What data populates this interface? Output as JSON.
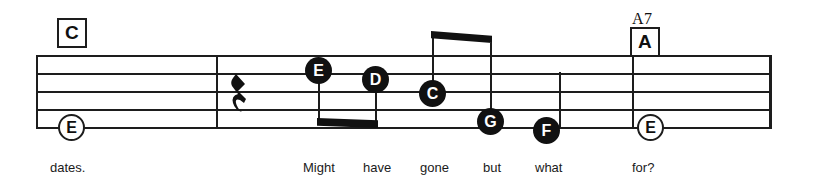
{
  "score": {
    "staff": {
      "line_count": 5,
      "top_y": 55,
      "line_spacing": 18,
      "left_x": 36,
      "right_x": 771
    },
    "barlines": [
      216,
      632
    ],
    "chords": [
      {
        "name": "chord-c",
        "label": "C",
        "superscript": "",
        "x": 57,
        "y": 18
      },
      {
        "name": "chord-a7",
        "label": "A",
        "superscript": "A7",
        "x": 630,
        "y": 24
      }
    ],
    "rest": {
      "label": "quarter-rest",
      "glyph": "➉",
      "x": 230,
      "y": 74
    },
    "notes": [
      {
        "pitch": "E",
        "head": "open",
        "x": 58,
        "y": 114,
        "stem": "none"
      },
      {
        "pitch": "E",
        "head": "filled",
        "x": 305,
        "y": 57,
        "stem": "down"
      },
      {
        "pitch": "D",
        "head": "filled",
        "x": 362,
        "y": 66,
        "stem": "down"
      },
      {
        "pitch": "C",
        "head": "filled",
        "x": 419,
        "y": 80,
        "stem": "up"
      },
      {
        "pitch": "G",
        "head": "filled",
        "x": 477,
        "y": 108,
        "stem": "up"
      },
      {
        "pitch": "F",
        "head": "filled",
        "x": 533,
        "y": 117,
        "stem": "up"
      },
      {
        "pitch": "E",
        "head": "open",
        "x": 637,
        "y": 114,
        "stem": "none"
      }
    ],
    "beams": [
      {
        "name": "beam-lower-ed",
        "x": 318,
        "y": 118,
        "width": 60,
        "height": 9,
        "slant": "down"
      },
      {
        "name": "beam-upper-cg",
        "x": 432,
        "y": 31,
        "width": 60,
        "height": 10,
        "slant": "down"
      }
    ],
    "lyrics": [
      {
        "text": "dates.",
        "x": 50
      },
      {
        "text": "Might",
        "x": 303
      },
      {
        "text": "have",
        "x": 363
      },
      {
        "text": "gone",
        "x": 420
      },
      {
        "text": "but",
        "x": 483
      },
      {
        "text": "what",
        "x": 535
      },
      {
        "text": "for?",
        "x": 632
      }
    ]
  }
}
